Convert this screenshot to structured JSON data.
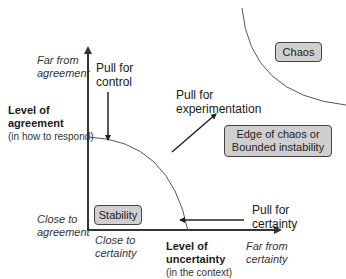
{
  "axes": {
    "y": {
      "title": "Level of agreement",
      "title_line1": "Level of",
      "title_line2": "agreement",
      "subtitle": "(in how to respond)",
      "top_label_line1": "Far from",
      "top_label_line2": "agreement",
      "bottom_label_line1": "Close to",
      "bottom_label_line2": "agreement"
    },
    "x": {
      "title_line1": "Level of",
      "title_line2": "uncertainty",
      "subtitle": "(in the context)",
      "left_label_line1": "Close to",
      "left_label_line2": "certainty",
      "right_label_line1": "Far from",
      "right_label_line2": "certainty"
    }
  },
  "zones": {
    "stability": "Stability",
    "edge_line1": "Edge of chaos or",
    "edge_line2": "Bounded instability",
    "chaos": "Chaos"
  },
  "pulls": {
    "control_line1": "Pull for",
    "control_line2": "control",
    "experimentation_line1": "Pull for",
    "experimentation_line2": "experimentation",
    "certainty_line1": "Pull for",
    "certainty_line2": "certainty"
  },
  "colors": {
    "box_fill": "#cfcfcf",
    "line": "#333333"
  }
}
